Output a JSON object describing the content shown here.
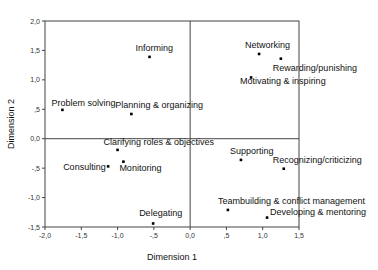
{
  "chart_data": {
    "type": "scatter",
    "title": "",
    "xlabel": "Dimension 1",
    "ylabel": "Dimension 2",
    "xlim": [
      -2.0,
      1.5
    ],
    "ylim": [
      -1.5,
      2.0
    ],
    "grid": false,
    "reference_lines": {
      "x": 0,
      "y": 0
    },
    "x_ticks": [
      -2.0,
      -1.5,
      -1.0,
      -0.5,
      0.0,
      0.5,
      1.0,
      1.5
    ],
    "x_tick_labels": [
      "-2,0",
      "-1,5",
      "-1,0",
      "-,5",
      "0,0",
      ",5",
      "1,0",
      "1,5"
    ],
    "y_ticks": [
      2.0,
      1.5,
      1.0,
      0.5,
      0.0,
      -0.5,
      -1.0,
      -1.5
    ],
    "y_tick_labels": [
      "2,0",
      "1,5",
      "1,0",
      ",5",
      "0,0",
      "-,5",
      "-1,0",
      "-1,5"
    ],
    "points": [
      {
        "label": "Informing",
        "x": -0.56,
        "y": 1.39,
        "label_dx": -14,
        "label_dy": -6
      },
      {
        "label": "Networking",
        "x": 0.95,
        "y": 1.44,
        "label_dx": -14,
        "label_dy": -6
      },
      {
        "label": "Rewarding/punishing",
        "x": 1.25,
        "y": 1.36,
        "label_dx": -8,
        "label_dy": 12
      },
      {
        "label": "Motivating & inspiring",
        "x": 0.84,
        "y": 1.04,
        "label_dx": -11,
        "label_dy": 6
      },
      {
        "label": "Problem solving",
        "x": -1.76,
        "y": 0.49,
        "label_dx": -11,
        "label_dy": -4
      },
      {
        "label": "Planning & organizing",
        "x": -0.81,
        "y": 0.42,
        "label_dx": -16,
        "label_dy": -6
      },
      {
        "label": "Clarifying roles & objectives",
        "x": -1.0,
        "y": -0.19,
        "label_dx": -14,
        "label_dy": -5
      },
      {
        "label": "Consulting",
        "x": -1.13,
        "y": -0.47,
        "label_dx": -45,
        "label_dy": 4
      },
      {
        "label": "Monitoring",
        "x": -0.92,
        "y": -0.39,
        "label_dx": -4,
        "label_dy": 9
      },
      {
        "label": "Delegating",
        "x": -0.51,
        "y": -1.44,
        "label_dx": -14,
        "label_dy": -7
      },
      {
        "label": "Supporting",
        "x": 0.7,
        "y": -0.36,
        "label_dx": -11,
        "label_dy": -6
      },
      {
        "label": "Recognizing/criticizing",
        "x": 1.29,
        "y": -0.51,
        "label_dx": -11,
        "label_dy": -6
      },
      {
        "label": "Teambuilding & conflict management",
        "x": 0.52,
        "y": -1.21,
        "label_dx": -10,
        "label_dy": -6
      },
      {
        "label": "Developing & mentoring",
        "x": 1.06,
        "y": -1.34,
        "label_dx": 3,
        "label_dy": -3
      }
    ]
  },
  "layout": {
    "plot_left": 45,
    "plot_right": 299,
    "plot_top": 21,
    "plot_bottom": 227
  }
}
